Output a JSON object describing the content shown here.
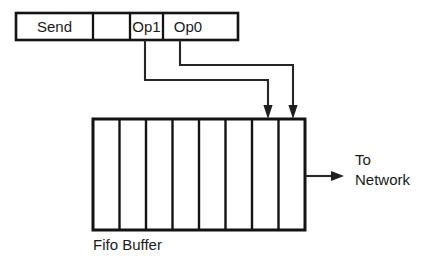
{
  "figure": {
    "background_color": "#ffffff",
    "line_color": "#262626",
    "text_color": "#1a1a1a"
  },
  "instruction_word": {
    "name": "send-instruction-word",
    "cells": [
      {
        "label": "Send",
        "has_label": true
      },
      {
        "label": "",
        "has_label": false
      },
      {
        "label": "Op1",
        "has_label": true
      },
      {
        "label": "Op0",
        "has_label": true
      }
    ]
  },
  "connectors": [
    {
      "name": "op1-connector",
      "source_field": "Op1",
      "target_slot_index": 7,
      "arrow": "down"
    },
    {
      "name": "op0-connector",
      "source_field": "Op0",
      "target_slot_index": 8,
      "arrow": "down"
    }
  ],
  "fifo_buffer": {
    "name": "fifo-buffer",
    "label": "Fifo Buffer",
    "slot_count": 8,
    "slots": [
      "",
      "",
      "",
      "",
      "",
      "",
      "",
      ""
    ]
  },
  "output": {
    "name": "network-output",
    "arrow": "right",
    "label_line_1": "To",
    "label_line_2": "Network"
  }
}
